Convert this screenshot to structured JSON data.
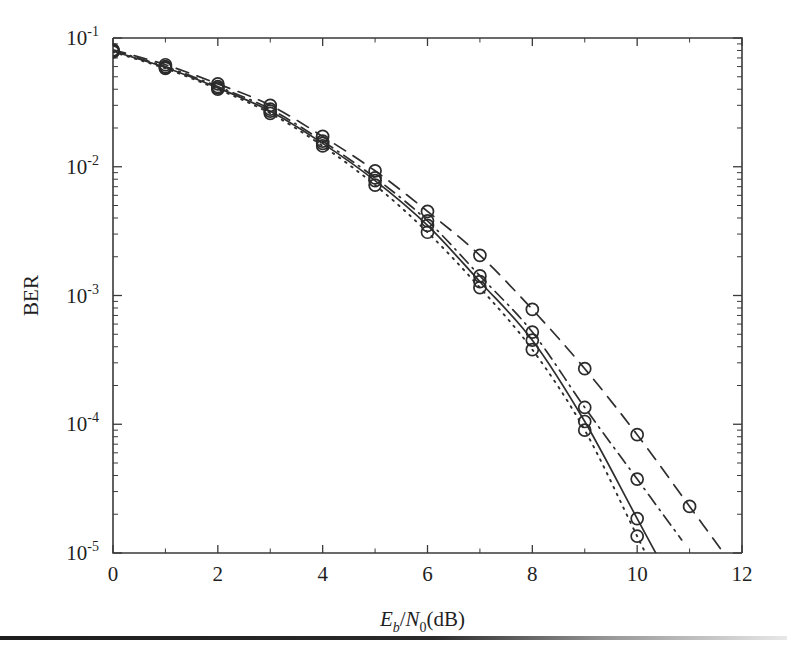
{
  "figure": {
    "name": "ber-vs-ebn0-plot",
    "background_color": "#ffffff",
    "line_color": "#2e2e2e",
    "axis_color": "#3a3a3a"
  },
  "chart_data": {
    "type": "line",
    "title": "",
    "xlabel": "Eb/N0(dB)",
    "xlabel_parts": {
      "E": "E",
      "b": "b",
      "slash": "/",
      "N": "N",
      "zero": "0",
      "unit": "(dB)"
    },
    "ylabel": "BER",
    "xlim": [
      0,
      12
    ],
    "ylim": [
      1e-05,
      0.1
    ],
    "yscale": "log",
    "grid": false,
    "legend": "none",
    "xticks": [
      0,
      2,
      4,
      6,
      8,
      10,
      12
    ],
    "xtick_labels": [
      "0",
      "2",
      "4",
      "6",
      "8",
      "10",
      "12"
    ],
    "yticks": [
      0.1,
      0.01,
      0.001,
      0.0001,
      1e-05
    ],
    "ytick_labels": [
      "10-1",
      "10-2",
      "10-3",
      "10-4",
      "10-5"
    ],
    "ytick_mantissa": "10",
    "ytick_exponents": [
      "-1",
      "-2",
      "-3",
      "-4",
      "-5"
    ],
    "marker": "circle",
    "marker_size": 6,
    "series": [
      {
        "name": "curve-dotted",
        "linestyle": "dotted",
        "x": [
          0,
          1,
          2,
          3,
          4,
          5,
          6,
          7,
          8,
          9,
          10
        ],
        "values": [
          0.078,
          0.058,
          0.04,
          0.026,
          0.0145,
          0.0072,
          0.0031,
          0.00115,
          0.00038,
          9e-05,
          1.35e-05
        ]
      },
      {
        "name": "curve-solid",
        "linestyle": "solid",
        "x": [
          0,
          1,
          2,
          3,
          4,
          5,
          6,
          7,
          8,
          9,
          10
        ],
        "values": [
          0.079,
          0.059,
          0.041,
          0.027,
          0.0152,
          0.0078,
          0.0035,
          0.00128,
          0.00045,
          0.000105,
          1.85e-05
        ]
      },
      {
        "name": "curve-dashdot",
        "linestyle": "dashdot",
        "x": [
          0,
          1,
          2,
          3,
          4,
          5,
          6,
          7,
          8,
          9,
          10
        ],
        "values": [
          0.08,
          0.06,
          0.042,
          0.028,
          0.0158,
          0.0082,
          0.0038,
          0.00142,
          0.00052,
          0.000135,
          3.75e-05
        ]
      },
      {
        "name": "curve-dashed",
        "linestyle": "dashed",
        "x": [
          0,
          1,
          2,
          3,
          4,
          5,
          6,
          7,
          8,
          9,
          10,
          11
        ],
        "values": [
          0.081,
          0.062,
          0.044,
          0.03,
          0.0172,
          0.0093,
          0.0045,
          0.00205,
          0.00078,
          0.00027,
          8.3e-05,
          2.3e-05
        ]
      }
    ],
    "marker_series": [
      {
        "name": "markers-dotted",
        "x": [
          0,
          1,
          2,
          3,
          4,
          5,
          6,
          7,
          8,
          9,
          10
        ],
        "values": [
          0.078,
          0.058,
          0.04,
          0.026,
          0.0145,
          0.0072,
          0.0031,
          0.00115,
          0.00038,
          9e-05,
          1.35e-05
        ]
      },
      {
        "name": "markers-solid",
        "x": [
          0,
          1,
          2,
          3,
          4,
          5,
          6,
          7,
          8,
          9,
          10
        ],
        "values": [
          0.079,
          0.059,
          0.041,
          0.027,
          0.0152,
          0.0078,
          0.0035,
          0.00128,
          0.00045,
          0.000105,
          1.85e-05
        ]
      },
      {
        "name": "markers-dashdot",
        "x": [
          0,
          1,
          2,
          3,
          4,
          5,
          6,
          7,
          8,
          9,
          10
        ],
        "values": [
          0.08,
          0.06,
          0.042,
          0.028,
          0.0158,
          0.0082,
          0.0038,
          0.00142,
          0.00052,
          0.000135,
          3.75e-05
        ]
      },
      {
        "name": "markers-dashed",
        "x": [
          0,
          1,
          2,
          3,
          4,
          5,
          6,
          7,
          8,
          9,
          10,
          11
        ],
        "values": [
          0.081,
          0.062,
          0.044,
          0.03,
          0.0172,
          0.0093,
          0.0045,
          0.00205,
          0.00078,
          0.00027,
          8.3e-05,
          2.3e-05
        ]
      }
    ]
  }
}
